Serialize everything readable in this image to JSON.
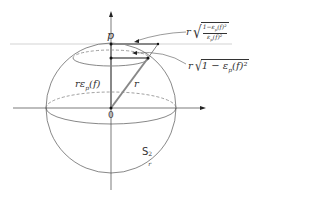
{
  "diagram": {
    "type": "sphere-geometry",
    "labels": {
      "point_p": "p",
      "origin": "0",
      "radius": "r",
      "height": "rε",
      "height_sub": "p",
      "height_arg": "(f)",
      "sphere_name": "S",
      "sphere_sup": "2",
      "sphere_sub": "r",
      "top_length_prefix": "r",
      "top_length_num": "1−ε",
      "top_length_num_sub": "p",
      "top_length_num_tail": "(f)²",
      "top_length_den": "ε",
      "top_length_den_sub": "p",
      "top_length_den_tail": "(f)²",
      "mid_length_prefix": "r",
      "mid_length_body": "1 − ε",
      "mid_length_sub": "p",
      "mid_length_tail": "(f)²"
    },
    "colors": {
      "line": "#555555",
      "thick_line": "#777777",
      "axis": "#444444",
      "tangent": "#bbbbbb"
    }
  }
}
